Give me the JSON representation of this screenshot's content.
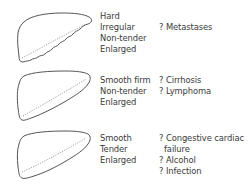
{
  "panels": [
    {
      "features": [
        "Hard",
        "Irregular",
        "Non-tender",
        "Enlarged"
      ],
      "causes": [
        {
          "text": "? Metastases",
          "indent": false
        }
      ],
      "outline": "irregular"
    },
    {
      "features": [
        "Smooth firm",
        "Non-tender",
        "Enlarged"
      ],
      "causes": [
        {
          "text": "? Cirrhosis",
          "indent": false
        },
        {
          "text": "? Lymphoma",
          "indent": false
        }
      ],
      "outline": "smooth"
    },
    {
      "features": [
        "Smooth",
        "Tender",
        "Enlarged"
      ],
      "causes": [
        {
          "text": "? Congestive cardiac",
          "indent": false
        },
        {
          "text": "failure",
          "indent": true
        },
        {
          "text": "? Alcohol",
          "indent": false
        },
        {
          "text": "? Infection",
          "indent": false
        }
      ],
      "outline": "smooth"
    }
  ],
  "colors": {
    "line": "#555555",
    "text": "#3a3a3a",
    "dotted": "#888888"
  }
}
